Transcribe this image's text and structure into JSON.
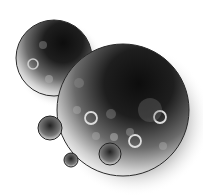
{
  "image": {
    "description": "Grayscale illustration of translucent spheres/bubbles with soft shadows",
    "colors": {
      "background": "#ffffff",
      "dark": "#111111",
      "outline": "#2a2a2a",
      "highlight": "#e8e8e8"
    }
  }
}
